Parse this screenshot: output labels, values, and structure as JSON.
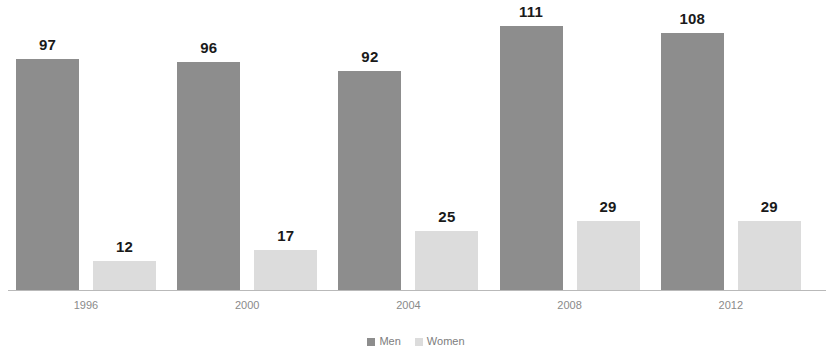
{
  "chart_data": {
    "type": "bar",
    "title": "",
    "subtitle": "",
    "xlabel": "",
    "ylabel": "",
    "categories": [
      "1996",
      "2000",
      "2004",
      "2008",
      "2012"
    ],
    "series": [
      {
        "name": "Men",
        "values": [
          97,
          96,
          92,
          111,
          108
        ],
        "color": "#8d8d8d"
      },
      {
        "name": "Women",
        "values": [
          12,
          17,
          25,
          29,
          29
        ],
        "color": "#dcdcdc"
      }
    ],
    "ylim": [
      0,
      122
    ],
    "grid": false,
    "data_labels": true,
    "legend_position": "bottom",
    "axis_color": "#b9b9b9",
    "label_color": "#1a1a1a",
    "tick_color": "#8a8a8a"
  },
  "legend": {
    "items": [
      {
        "label": "Men",
        "marker": "square-swatch-men"
      },
      {
        "label": "Women",
        "marker": "square-swatch-women"
      }
    ]
  }
}
